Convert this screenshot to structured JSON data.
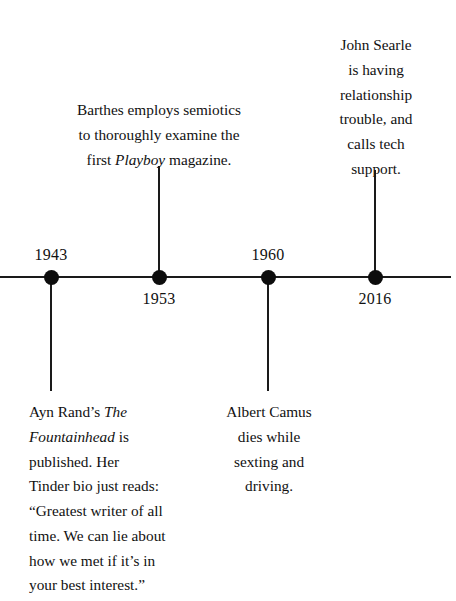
{
  "diagram": {
    "type": "timeline",
    "orientation": "horizontal",
    "axis": {
      "y": 277,
      "x_start": 0,
      "x_end": 451
    },
    "events": [
      {
        "year": "1943",
        "x": 51,
        "year_label_side": "above",
        "note_side": "below",
        "note_align": "left",
        "note_lines": [
          {
            "text": "Ayn Rand’s ",
            "italic_text": "The",
            "tail": ""
          },
          {
            "text": "",
            "italic_text": "Fountainhead",
            "tail": " is"
          },
          {
            "text": "published. Her",
            "italic_text": "",
            "tail": ""
          },
          {
            "text": "Tinder bio just reads:",
            "italic_text": "",
            "tail": ""
          },
          {
            "text": "“Greatest writer of all",
            "italic_text": "",
            "tail": ""
          },
          {
            "text": "time. We can lie about",
            "italic_text": "",
            "tail": ""
          },
          {
            "text": "how we met if it’s in",
            "italic_text": "",
            "tail": ""
          },
          {
            "text": "your best interest.”",
            "italic_text": "",
            "tail": ""
          }
        ]
      },
      {
        "year": "1953",
        "x": 159,
        "year_label_side": "below",
        "note_side": "above",
        "note_align": "center",
        "note_lines": [
          {
            "text": "Barthes employs semiotics",
            "italic_text": "",
            "tail": ""
          },
          {
            "text": "to thoroughly examine the",
            "italic_text": "",
            "tail": ""
          },
          {
            "text": "first ",
            "italic_text": "Playboy",
            "tail": " magazine."
          }
        ]
      },
      {
        "year": "1960",
        "x": 268,
        "year_label_side": "above",
        "note_side": "below",
        "note_align": "center",
        "note_lines": [
          {
            "text": "Albert Camus",
            "italic_text": "",
            "tail": ""
          },
          {
            "text": "dies while",
            "italic_text": "",
            "tail": ""
          },
          {
            "text": "sexting and",
            "italic_text": "",
            "tail": ""
          },
          {
            "text": "driving.",
            "italic_text": "",
            "tail": ""
          }
        ]
      },
      {
        "year": "2016",
        "x": 375,
        "year_label_side": "below",
        "note_side": "above",
        "note_align": "center",
        "note_lines": [
          {
            "text": "John Searle",
            "italic_text": "",
            "tail": ""
          },
          {
            "text": "is having",
            "italic_text": "",
            "tail": ""
          },
          {
            "text": "relationship",
            "italic_text": "",
            "tail": ""
          },
          {
            "text": "trouble, and",
            "italic_text": "",
            "tail": ""
          },
          {
            "text": "calls tech",
            "italic_text": "",
            "tail": ""
          },
          {
            "text": "support.",
            "italic_text": "",
            "tail": ""
          }
        ]
      }
    ],
    "colors": {
      "background": "#ffffff",
      "ink": "#111111",
      "line": "#1a1a1a",
      "dot": "#0d0d0d"
    }
  }
}
